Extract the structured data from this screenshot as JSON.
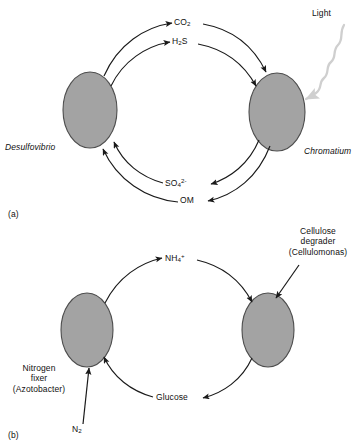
{
  "figure": {
    "background_color": "#ffffff",
    "cell_fill_color": "#a3a3a3",
    "cell_stroke_color": "#4d4d4d",
    "arrow_color": "#1a1a1a",
    "light_arrow_color": "#cfcfcf"
  },
  "panels": [
    {
      "id": "a",
      "panel_label": "(a)",
      "organisms": [
        {
          "name": "left-cell",
          "label": "Desulfovibrio",
          "italic": true
        },
        {
          "name": "right-cell",
          "label": "Chromatium",
          "italic": true
        }
      ],
      "external_input": {
        "label": "Light",
        "arrow_style": "wavy",
        "color": "#cfcfcf"
      },
      "flows": [
        {
          "from": "Desulfovibrio",
          "to": "Chromatium",
          "label": "CO2",
          "label_html": "CO<sub>2</sub>",
          "direction": "left-to-right"
        },
        {
          "from": "Desulfovibrio",
          "to": "Chromatium",
          "label": "H2S",
          "label_html": "H<sub>2</sub>S",
          "direction": "left-to-right"
        },
        {
          "from": "Chromatium",
          "to": "Desulfovibrio",
          "label": "SO42-",
          "label_html": "SO<sub>4</sub><sup>2-</sup>",
          "direction": "right-to-left"
        },
        {
          "from": "Chromatium",
          "to": "Desulfovibrio",
          "label": "OM",
          "label_html": "OM",
          "direction": "right-to-left"
        }
      ]
    },
    {
      "id": "b",
      "panel_label": "(b)",
      "organisms": [
        {
          "name": "left-cell",
          "label": "Nitrogen fixer",
          "sub_label": "(Azotobacter)",
          "line1": "Nitrogen",
          "line2": "fixer",
          "line3": "(Azotobacter)"
        },
        {
          "name": "right-cell",
          "label": "Cellulose degrader",
          "sub_label": "(Cellulomonas)",
          "line1": "Cellulose",
          "line2": "degrader",
          "line3": "(Cellulomonas)"
        }
      ],
      "external_input": {
        "label": "N2",
        "label_html": "N<sub>2</sub>",
        "arrow_style": "straight"
      },
      "flows": [
        {
          "from": "Nitrogen fixer",
          "to": "Cellulose degrader",
          "label": "NH4+",
          "label_html": "NH<sub>4</sub><sup>+</sup>",
          "direction": "left-to-right"
        },
        {
          "from": "Cellulose degrader",
          "to": "Nitrogen fixer",
          "label": "Glucose",
          "label_html": "Glucose",
          "direction": "right-to-left"
        }
      ]
    }
  ]
}
